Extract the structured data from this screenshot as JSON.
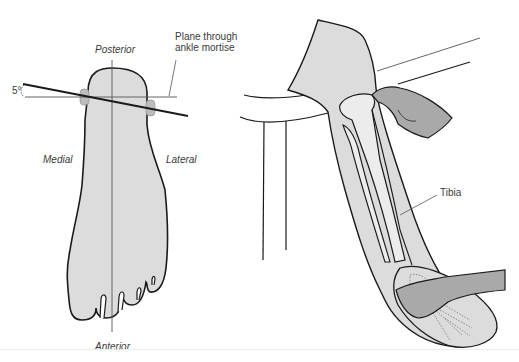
{
  "figure": {
    "left_panel": {
      "title": "Foot — plantar/top view with ankle mortise plane",
      "labels": {
        "posterior": "Posterior",
        "anterior": "Anterior",
        "medial": "Medial",
        "lateral": "Lateral",
        "angle": "5°",
        "plane_line1": "Plane through",
        "plane_line2": "ankle mortise"
      }
    },
    "right_panel": {
      "title": "Leg over table edge, examiner hands on knee and foot",
      "labels": {
        "tibia": "Tibia"
      }
    },
    "colors": {
      "skin_fill": "#dcdcdc",
      "bone_fill": "#ececec",
      "hand_fill": "#a9a9a9",
      "outline": "#1a1a1a",
      "leader_line": "#555555",
      "text": "#3a3a3a"
    }
  }
}
